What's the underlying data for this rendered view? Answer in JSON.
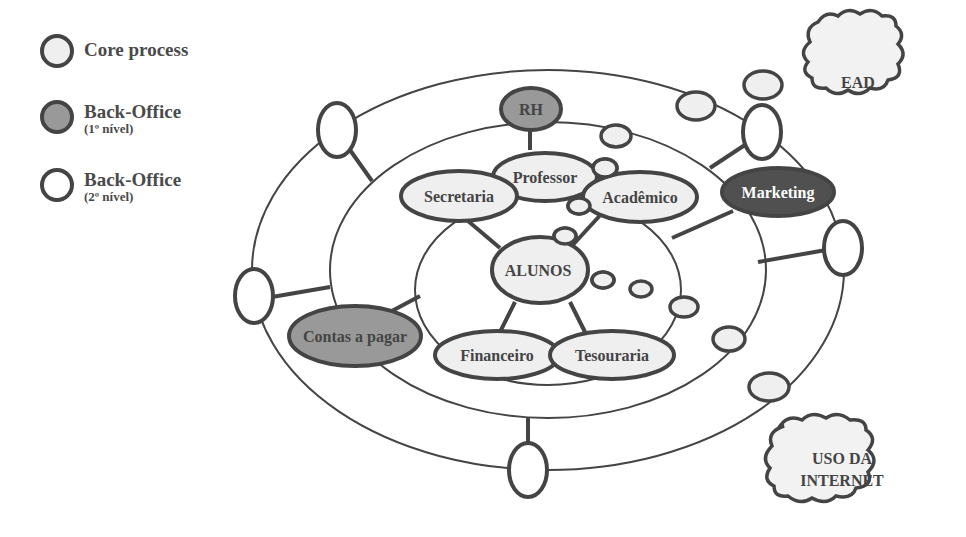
{
  "legend": {
    "items": [
      {
        "label": "Core process",
        "sublabel": "",
        "fill": "#efefef"
      },
      {
        "label": "Back-Office",
        "sublabel": "(1º nível)",
        "fill": "#999999"
      },
      {
        "label": "Back-Office",
        "sublabel": "(2º nível)",
        "fill": "#ffffff"
      }
    ]
  },
  "colors": {
    "stroke": "#444444",
    "core_fill": "#efefef",
    "backoffice1_fill": "#999999",
    "backoffice1_dark_fill": "#505050",
    "backoffice2_fill": "#ffffff",
    "text": "#444444",
    "text_on_dark": "#ffffff"
  },
  "diagram": {
    "center_node": "ALUNOS",
    "core_nodes": [
      "Professor",
      "Secretaria",
      "Acadêmico",
      "Financeiro",
      "Tesouraria"
    ],
    "backoffice_level1_nodes": [
      "RH",
      "Marketing",
      "Contas a pagar"
    ],
    "clouds": [
      {
        "label_lines": [
          "EAD"
        ]
      },
      {
        "label_lines": [
          "USO DA",
          "INTERNET"
        ]
      }
    ]
  }
}
